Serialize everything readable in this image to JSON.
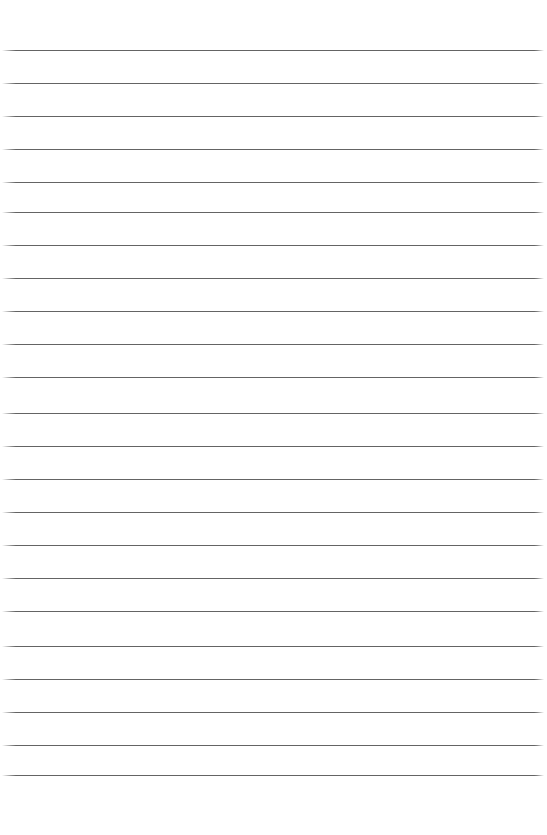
{
  "page": {
    "kind": "ruled-notebook-paper",
    "width": 547,
    "height": 835,
    "background_color": "#ffffff",
    "content_text": "",
    "has_text": false,
    "has_margin_rule": false
  },
  "ruling": {
    "line_color": "#575757",
    "line_thickness_px": 1,
    "line_spacing_px": 33,
    "line_count": 23,
    "first_line_y": 50,
    "last_line_y": 775,
    "line_left_x": 2,
    "line_right_x": 544,
    "top_margin_px": 50,
    "bottom_margin_px": 60,
    "lines": [
      {
        "index": 1,
        "y": 50,
        "x1": 2,
        "x2": 544
      },
      {
        "index": 2,
        "y": 83,
        "x1": 2,
        "x2": 544
      },
      {
        "index": 3,
        "y": 116,
        "x1": 2,
        "x2": 544
      },
      {
        "index": 4,
        "y": 149,
        "x1": 2,
        "x2": 544
      },
      {
        "index": 5,
        "y": 182,
        "x1": 2,
        "x2": 544
      },
      {
        "index": 6,
        "y": 212,
        "x1": 2,
        "x2": 544
      },
      {
        "index": 7,
        "y": 245,
        "x1": 2,
        "x2": 544
      },
      {
        "index": 8,
        "y": 278,
        "x1": 2,
        "x2": 544
      },
      {
        "index": 9,
        "y": 311,
        "x1": 2,
        "x2": 544
      },
      {
        "index": 10,
        "y": 344,
        "x1": 2,
        "x2": 544
      },
      {
        "index": 11,
        "y": 377,
        "x1": 2,
        "x2": 544
      },
      {
        "index": 12,
        "y": 413,
        "x1": 2,
        "x2": 544
      },
      {
        "index": 13,
        "y": 446,
        "x1": 2,
        "x2": 544
      },
      {
        "index": 14,
        "y": 479,
        "x1": 2,
        "x2": 544
      },
      {
        "index": 15,
        "y": 512,
        "x1": 2,
        "x2": 544
      },
      {
        "index": 16,
        "y": 545,
        "x1": 2,
        "x2": 544
      },
      {
        "index": 17,
        "y": 578,
        "x1": 2,
        "x2": 544
      },
      {
        "index": 18,
        "y": 611,
        "x1": 2,
        "x2": 544
      },
      {
        "index": 19,
        "y": 646,
        "x1": 2,
        "x2": 544
      },
      {
        "index": 20,
        "y": 679,
        "x1": 2,
        "x2": 544
      },
      {
        "index": 21,
        "y": 712,
        "x1": 2,
        "x2": 544
      },
      {
        "index": 22,
        "y": 745,
        "x1": 2,
        "x2": 544
      },
      {
        "index": 23,
        "y": 775,
        "x1": 2,
        "x2": 544
      }
    ]
  }
}
